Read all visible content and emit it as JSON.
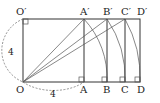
{
  "diagram": {
    "points": {
      "O": "O",
      "O_prime": "O′",
      "A": "A",
      "A_prime": "A′",
      "B": "B",
      "B_prime": "B′",
      "C": "C",
      "C_prime": "C′",
      "D": "D",
      "D_prime": "D′"
    },
    "side_labels": {
      "left": "4",
      "bottom": "4"
    }
  }
}
